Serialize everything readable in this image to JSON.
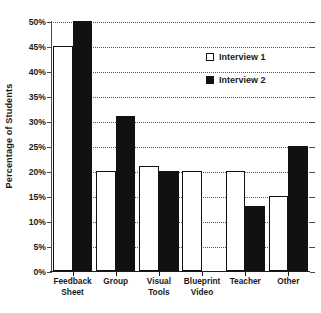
{
  "chart_data": {
    "type": "bar",
    "title": "",
    "xlabel": "",
    "ylabel": "Percentage of Students",
    "categories": [
      "Feedback\nSheet",
      "Group",
      "Visual\nTools",
      "Blueprint\nVideo",
      "Teacher",
      "Other"
    ],
    "category_lines": [
      [
        "Feedback",
        "Sheet"
      ],
      [
        "Group",
        ""
      ],
      [
        "Visual",
        "Tools"
      ],
      [
        "Blueprint",
        "Video"
      ],
      [
        "Teacher",
        ""
      ],
      [
        "Other",
        ""
      ]
    ],
    "series": [
      {
        "name": "Interview 1",
        "style": "hollow",
        "color": "#ffffff",
        "edge_color": "#111111",
        "values": [
          45,
          20,
          21,
          20,
          20,
          15
        ]
      },
      {
        "name": "Interview 2",
        "style": "filled",
        "color": "#111111",
        "edge_color": "#111111",
        "values": [
          50,
          31,
          20,
          0,
          13,
          25
        ]
      }
    ],
    "ylim": [
      0,
      50
    ],
    "ytick_values": [
      0,
      5,
      10,
      15,
      20,
      25,
      30,
      35,
      40,
      45,
      50
    ],
    "ytick_labels": [
      "0%",
      "5%",
      "10%",
      "15%",
      "20%",
      "25%",
      "30%",
      "35%",
      "40%",
      "45%",
      "50%"
    ],
    "grid": true,
    "grid_style": "dotted",
    "grid_axis": "y",
    "legend_position": "upper right (inside axes)",
    "legend_entries": [
      "Interview 1",
      "Interview 2"
    ]
  }
}
